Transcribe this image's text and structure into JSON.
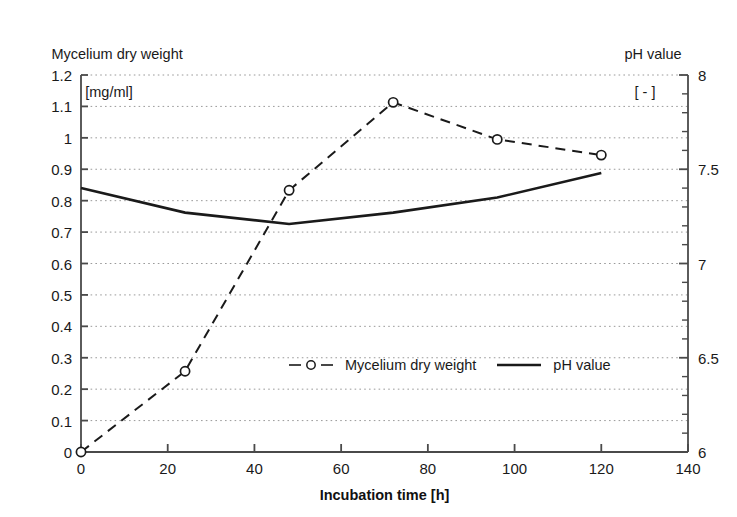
{
  "chart_data": {
    "type": "line",
    "title": "",
    "xlabel": "Incubation time [h]",
    "ylabel": "Mycelium dry weight\n[mg/ml]",
    "y2label": "pH value\n[ - ]",
    "x": [
      0,
      24,
      48,
      72,
      96,
      120
    ],
    "xlim": [
      0,
      140
    ],
    "ylim": [
      0,
      1.2
    ],
    "y2lim": [
      6,
      8
    ],
    "grid": true,
    "legend_position": "center",
    "series": [
      {
        "name": "Mycelium dry weight",
        "axis": "left",
        "style": "dashed",
        "marker": "open-circle",
        "color": "#1a1a1a",
        "values": [
          0.0,
          0.257,
          0.833,
          1.113,
          0.995,
          0.945
        ]
      },
      {
        "name": "pH value",
        "axis": "right",
        "style": "solid",
        "marker": "none",
        "color": "#1a1a1a",
        "values": [
          7.4,
          7.27,
          7.21,
          7.27,
          7.35,
          7.48
        ]
      }
    ]
  },
  "axes": {
    "left": {
      "title_main": "Mycelium dry weight",
      "title_unit": "[mg/ml]",
      "ticks": [
        "1.2",
        "1.1",
        "1",
        "0.9",
        "0.8",
        "0.7",
        "0.6",
        "0.5",
        "0.4",
        "0.3",
        "0.2",
        "0.1",
        "0"
      ],
      "tick_values": [
        1.2,
        1.1,
        1.0,
        0.9,
        0.8,
        0.7,
        0.6,
        0.5,
        0.4,
        0.3,
        0.2,
        0.1,
        0.0
      ]
    },
    "right": {
      "title_main": "pH value",
      "title_unit": "[ - ]",
      "ticks": [
        "8",
        "7.5",
        "7",
        "6.5",
        "6"
      ],
      "tick_values": [
        8,
        7.5,
        7,
        6.5,
        6
      ]
    },
    "bottom": {
      "title": "Incubation time [h]",
      "ticks": [
        "0",
        "20",
        "40",
        "60",
        "80",
        "100",
        "120",
        "140"
      ],
      "tick_values": [
        0,
        20,
        40,
        60,
        80,
        100,
        120,
        140
      ]
    }
  },
  "legend": {
    "items": [
      {
        "label": "Mycelium dry weight",
        "symbol": "dashed-line-open-circle"
      },
      {
        "label": "pH value",
        "symbol": "solid-line"
      }
    ]
  },
  "colors": {
    "line": "#1a1a1a",
    "grid": "#9a9a9a",
    "axis": "#4a4a4a",
    "background": "#ffffff"
  }
}
